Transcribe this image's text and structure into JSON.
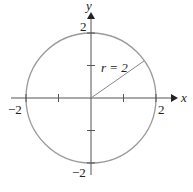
{
  "diagram": {
    "axes": {
      "x_label": "x",
      "y_label": "y",
      "x_ticks": [
        "-2",
        "2"
      ],
      "y_ticks": [
        "2",
        "-2"
      ]
    },
    "circle": {
      "center": [
        0,
        0
      ],
      "radius": 2
    },
    "radius_label": "r = 2",
    "colors": {
      "circle": "#999999",
      "axes": "#555555",
      "radius_line": "#888888"
    }
  }
}
